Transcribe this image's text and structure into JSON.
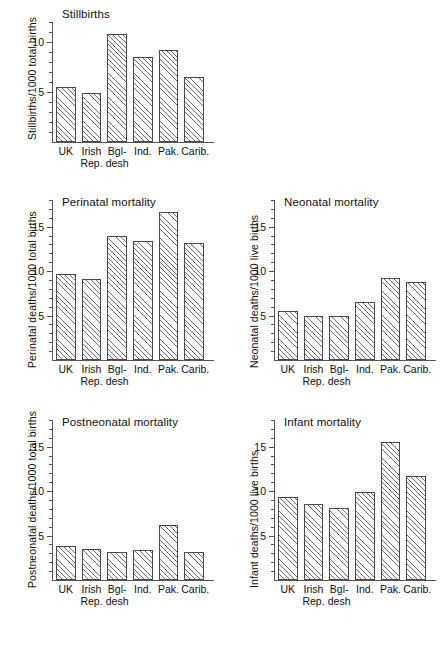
{
  "figure": {
    "categories": [
      "UK",
      "Irish Rep.",
      "Bgl-desh",
      "Ind.",
      "Pak.",
      "Carib."
    ],
    "category_lines": [
      {
        "l1": "UK",
        "l2": ""
      },
      {
        "l1": "Irish",
        "l2": "Rep."
      },
      {
        "l1": "Bgl-",
        "l2": "desh"
      },
      {
        "l1": "Ind.",
        "l2": ""
      },
      {
        "l1": "Pak.",
        "l2": ""
      },
      {
        "l1": "Carib.",
        "l2": ""
      }
    ]
  },
  "chart_data": [
    {
      "type": "bar",
      "id": "stillbirths",
      "title": "Stillbirths",
      "xlabel": "",
      "ylabel": "Stillbirths/1000 total births",
      "categories": [
        "UK",
        "Irish Rep.",
        "Bgl-desh",
        "Ind.",
        "Pak.",
        "Carib."
      ],
      "values": [
        5.5,
        4.9,
        10.8,
        8.5,
        9.2,
        6.5
      ],
      "ylim": [
        0,
        12
      ],
      "yticks": [
        5,
        10
      ],
      "yticklabels": [
        "5",
        "10"
      ],
      "yminor_step": 1,
      "grid": false,
      "legend": "none"
    },
    {
      "type": "bar",
      "id": "perinatal",
      "title": "Perinatal mortality",
      "xlabel": "",
      "ylabel": "Perinatal deaths/1000 total births",
      "categories": [
        "UK",
        "Irish Rep.",
        "Bgl-desh",
        "Ind.",
        "Pak.",
        "Carib."
      ],
      "values": [
        9.7,
        9.1,
        14.0,
        13.4,
        16.7,
        13.2
      ],
      "ylim": [
        0,
        18
      ],
      "yticks": [
        5,
        10,
        15
      ],
      "yticklabels": [
        "5",
        "10",
        "15"
      ],
      "yminor_step": 1,
      "grid": false,
      "legend": "none"
    },
    {
      "type": "bar",
      "id": "neonatal",
      "title": "Neonatal mortality",
      "xlabel": "",
      "ylabel": "Neonatal deaths/1000 live births",
      "categories": [
        "UK",
        "Irish Rep.",
        "Bgl-desh",
        "Ind.",
        "Pak.",
        "Carib."
      ],
      "values": [
        5.5,
        4.9,
        4.9,
        6.5,
        9.2,
        8.8
      ],
      "ylim": [
        0,
        18
      ],
      "yticks": [
        5,
        10,
        15
      ],
      "yticklabels": [
        "5",
        "10",
        "15"
      ],
      "yminor_step": 1,
      "grid": false,
      "legend": "none"
    },
    {
      "type": "bar",
      "id": "postneonatal",
      "title": "Postneonatal mortality",
      "xlabel": "",
      "ylabel": "Postneonatal deaths/1000 total births",
      "categories": [
        "UK",
        "Irish Rep.",
        "Bgl-desh",
        "Ind.",
        "Pak.",
        "Carib."
      ],
      "values": [
        3.8,
        3.5,
        3.1,
        3.4,
        6.2,
        3.1
      ],
      "ylim": [
        0,
        18
      ],
      "yticks": [
        5,
        10,
        15
      ],
      "yticklabels": [
        "5",
        "10",
        "15"
      ],
      "yminor_step": 1,
      "grid": false,
      "legend": "none"
    },
    {
      "type": "bar",
      "id": "infant",
      "title": "Infant mortality",
      "xlabel": "",
      "ylabel": "Infant deaths/1000 live births",
      "categories": [
        "UK",
        "Irish Rep.",
        "Bgl-desh",
        "Ind.",
        "Pak.",
        "Carib."
      ],
      "values": [
        9.3,
        8.5,
        8.1,
        9.9,
        15.5,
        11.7
      ],
      "ylim": [
        0,
        18
      ],
      "yticks": [
        5,
        10,
        15
      ],
      "yticklabels": [
        "5",
        "10",
        "15"
      ],
      "yminor_step": 1,
      "grid": false,
      "legend": "none"
    }
  ]
}
